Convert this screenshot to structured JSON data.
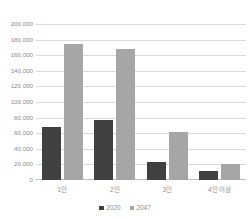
{
  "chart_data": {
    "type": "bar",
    "title": "",
    "xlabel": "",
    "ylabel": "",
    "categories": [
      "1인",
      "2인",
      "3인",
      "4인 이상"
    ],
    "series": [
      {
        "name": "2020",
        "color": "#404040",
        "values": [
          68000,
          77000,
          23000,
          11500
        ]
      },
      {
        "name": "2047",
        "color": "#a6a6a6",
        "values": [
          175000,
          168000,
          61000,
          21000
        ]
      }
    ],
    "ylim": [
      0,
      200000
    ],
    "ytick_step": 20000,
    "ytick_labels": [
      "200,000",
      "180,000",
      "160,000",
      "140,000",
      "120,000",
      "100,000",
      "80,000",
      "60,000",
      "40,000",
      "20,000",
      "0"
    ],
    "grid": true,
    "grid_axis": "y",
    "legend_position": "bottom",
    "background": "#ffffff",
    "grid_color": "#d9d9d9",
    "text_color": "#8c8c8c"
  }
}
